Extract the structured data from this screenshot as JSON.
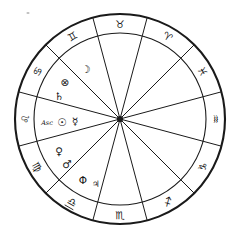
{
  "chart": {
    "kind": "astrological-birth-chart-wheel",
    "house_count": 12,
    "geometry": {
      "center_x": 120,
      "center_y": 119,
      "outer_radius": 105,
      "inner_radius": 86,
      "rotation_offset_deg": 15
    },
    "colors": {
      "ink": "#1a1a1a",
      "glyph": "#161616",
      "background": "#ffffff",
      "speck": "#bdbdbd"
    },
    "signs": [
      {
        "name": "Taurus",
        "glyph": "♉",
        "angle_deg": 270,
        "position": "top"
      },
      {
        "name": "Gemini",
        "glyph": "♊",
        "angle_deg": 240,
        "position": "upper-left"
      },
      {
        "name": "Cancer",
        "glyph": "♋",
        "angle_deg": 210,
        "position": "left-upper"
      },
      {
        "name": "Leo",
        "glyph": "♌",
        "angle_deg": 180,
        "position": "left"
      },
      {
        "name": "Virgo",
        "glyph": "♍",
        "angle_deg": 150,
        "position": "left-lower"
      },
      {
        "name": "Libra",
        "glyph": "♎",
        "angle_deg": 120,
        "position": "lower-left",
        "underlined": true
      },
      {
        "name": "Scorpio",
        "glyph": "♏",
        "angle_deg": 90,
        "position": "bottom"
      },
      {
        "name": "Sagittarius",
        "glyph": "♐",
        "angle_deg": 60,
        "position": "lower-right"
      },
      {
        "name": "Capricorn",
        "glyph": "♑",
        "angle_deg": 30,
        "position": "right-lower"
      },
      {
        "name": "Aquarius",
        "glyph": "♒",
        "angle_deg": 0,
        "position": "right"
      },
      {
        "name": "Pisces",
        "glyph": "♓",
        "angle_deg": 330,
        "position": "right-upper"
      },
      {
        "name": "Aries",
        "glyph": "♈",
        "angle_deg": 300,
        "position": "upper-right"
      }
    ],
    "points": [
      {
        "name": "Moon",
        "glyph": "☽",
        "x": 86,
        "y": 69,
        "size": "normal"
      },
      {
        "name": "Part of Fortune",
        "glyph": "⊗",
        "x": 65,
        "y": 82,
        "size": "normal"
      },
      {
        "name": "Saturn",
        "glyph": "♄",
        "x": 59,
        "y": 96,
        "size": "normal"
      },
      {
        "name": "Ascendant",
        "glyph": "Asc",
        "x": 47,
        "y": 123,
        "size": "label"
      },
      {
        "name": "Sun",
        "glyph": "☉",
        "x": 62,
        "y": 122,
        "size": "normal"
      },
      {
        "name": "Mercury",
        "glyph": "☿",
        "x": 75,
        "y": 121,
        "size": "normal"
      },
      {
        "name": "Venus",
        "glyph": "♀",
        "x": 59,
        "y": 151,
        "size": "normal"
      },
      {
        "name": "Mars",
        "glyph": "♂",
        "x": 67,
        "y": 164,
        "size": "normal"
      },
      {
        "name": "Phi Point",
        "glyph": "Φ",
        "x": 83,
        "y": 180,
        "size": "normal"
      },
      {
        "name": "Jupiter",
        "glyph": "♃",
        "x": 96,
        "y": 184,
        "size": "small"
      }
    ]
  }
}
